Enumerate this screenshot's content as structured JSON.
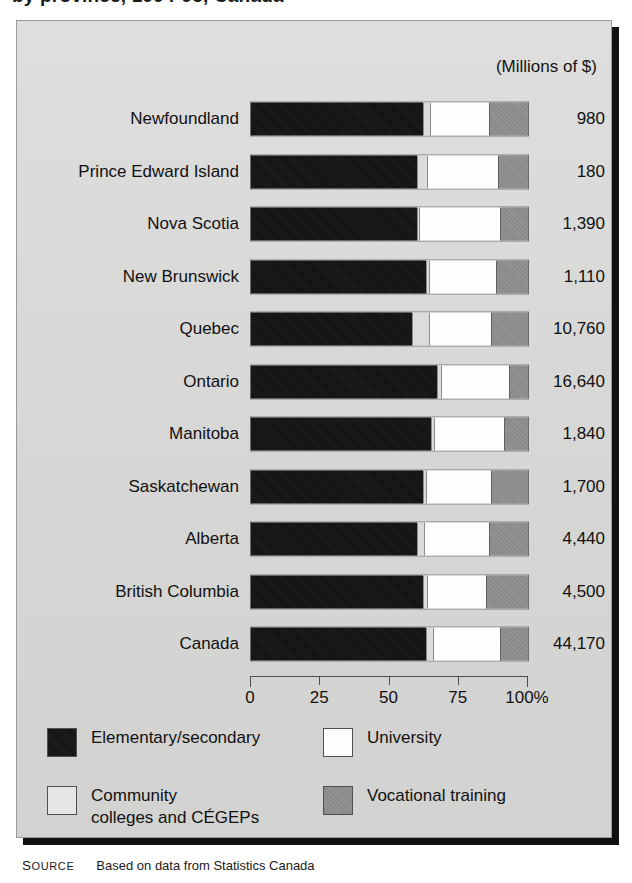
{
  "title": "by province, 1994-95, Canada",
  "units_caption": "(Millions of $)",
  "axis": {
    "ticks": [
      "0",
      "25",
      "50",
      "75",
      "100%"
    ],
    "tick_values": [
      0,
      25,
      50,
      75,
      100
    ]
  },
  "legend": {
    "elementary": "Elementary/secondary",
    "university": "University",
    "community": "Community\ncolleges and CÉGEPs",
    "vocational": "Vocational training"
  },
  "colors": {
    "elementary": "#121212",
    "community": "#dcdcda",
    "university": "#fdfdfd",
    "vocational": "#8a8a88",
    "panel_background": "#d9d9d7"
  },
  "source": {
    "kicker": "Source",
    "text": "Based on data from Statistics Canada"
  },
  "chart_data": {
    "type": "bar",
    "orientation": "horizontal",
    "stacked": true,
    "normalized": true,
    "title": "by province, 1994-95, Canada",
    "xlabel": "",
    "ylabel": "",
    "xlim": [
      0,
      100
    ],
    "grid": false,
    "legend_position": "bottom",
    "categories": [
      "Newfoundland",
      "Prince Edward Island",
      "Nova Scotia",
      "New Brunswick",
      "Quebec",
      "Ontario",
      "Manitoba",
      "Saskatchewan",
      "Alberta",
      "British Columbia",
      "Canada"
    ],
    "series": [
      {
        "name": "Elementary/secondary",
        "color": "#121212",
        "values": [
          62,
          60,
          60,
          63,
          58,
          67,
          65,
          62,
          60,
          62,
          63
        ]
      },
      {
        "name": "Community colleges and CÉGEPs",
        "color": "#dcdcda",
        "values": [
          3,
          4,
          1,
          1.5,
          6.5,
          2,
          1.5,
          1.5,
          3,
          2,
          3
        ]
      },
      {
        "name": "University",
        "color": "#fdfdfd",
        "values": [
          21,
          25,
          29,
          24,
          22,
          24,
          25,
          23,
          23,
          21,
          24
        ]
      },
      {
        "name": "Vocational training",
        "color": "#8a8a88",
        "values": [
          14,
          11,
          10,
          11.5,
          13.5,
          7,
          8.5,
          13.5,
          14,
          15,
          10
        ]
      }
    ],
    "value_labels": {
      "units": "Millions of $",
      "values": [
        "980",
        "180",
        "1,390",
        "1,110",
        "10,760",
        "16,640",
        "1,840",
        "1,700",
        "4,440",
        "4,500",
        "44,170"
      ]
    }
  },
  "rows": [
    {
      "label": "Newfoundland",
      "value": "980",
      "elementary": 62,
      "community": 3,
      "university": 21,
      "vocational": 14
    },
    {
      "label": "Prince Edward Island",
      "value": "180",
      "elementary": 60,
      "community": 4,
      "university": 25,
      "vocational": 11
    },
    {
      "label": "Nova Scotia",
      "value": "1,390",
      "elementary": 60,
      "community": 1,
      "university": 29,
      "vocational": 10
    },
    {
      "label": "New Brunswick",
      "value": "1,110",
      "elementary": 63,
      "community": 1.5,
      "university": 24,
      "vocational": 11.5
    },
    {
      "label": "Quebec",
      "value": "10,760",
      "elementary": 58,
      "community": 6.5,
      "university": 22,
      "vocational": 13.5
    },
    {
      "label": "Ontario",
      "value": "16,640",
      "elementary": 67,
      "community": 2,
      "university": 24,
      "vocational": 7
    },
    {
      "label": "Manitoba",
      "value": "1,840",
      "elementary": 65,
      "community": 1.5,
      "university": 25,
      "vocational": 8.5
    },
    {
      "label": "Saskatchewan",
      "value": "1,700",
      "elementary": 62,
      "community": 1.5,
      "university": 23,
      "vocational": 13.5
    },
    {
      "label": "Alberta",
      "value": "4,440",
      "elementary": 60,
      "community": 3,
      "university": 23,
      "vocational": 14
    },
    {
      "label": "British Columbia",
      "value": "4,500",
      "elementary": 62,
      "community": 2,
      "university": 21,
      "vocational": 15
    },
    {
      "label": "Canada",
      "value": "44,170",
      "elementary": 63,
      "community": 3,
      "university": 24,
      "vocational": 10
    }
  ]
}
